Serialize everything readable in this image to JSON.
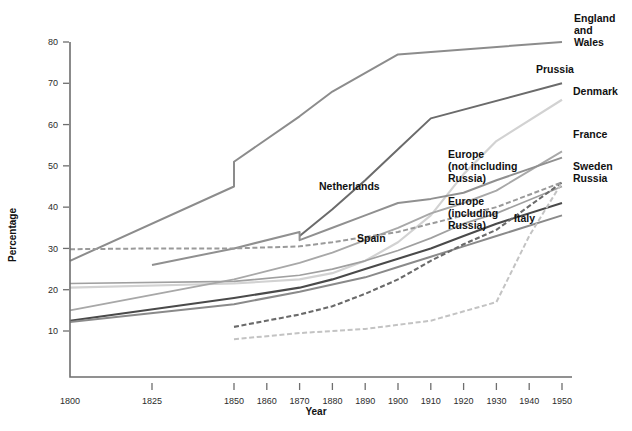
{
  "chart_data": {
    "type": "line",
    "title": "",
    "xlabel": "Year",
    "ylabel": "Percentage",
    "xlim": [
      1795,
      1955
    ],
    "ylim": [
      3,
      83
    ],
    "grid": false,
    "legend_position": "inline-right-labels",
    "x_ticks": [
      "1800",
      "1825",
      "1850",
      "1860",
      "1870",
      "1880",
      "1890",
      "1900",
      "1910",
      "1920",
      "1930",
      "1940",
      "1950"
    ],
    "x_tick_values": [
      1800,
      1825,
      1850,
      1860,
      1870,
      1880,
      1890,
      1900,
      1910,
      1920,
      1930,
      1940,
      1950
    ],
    "y_ticks": [
      "10",
      "20",
      "30",
      "40",
      "50",
      "60",
      "70",
      "80"
    ],
    "y_tick_values": [
      10,
      20,
      30,
      40,
      50,
      60,
      70,
      80
    ],
    "series": [
      {
        "name": "England and Wales",
        "label": "England\nand\nWales",
        "color": "#8c8c8c",
        "style": "solid",
        "width": 2.0,
        "x": [
          1800,
          1850,
          1850,
          1870,
          1880,
          1900,
          1950
        ],
        "y": [
          27,
          45,
          51,
          62,
          68,
          77,
          80
        ]
      },
      {
        "name": "Prussia",
        "label": "Prussia",
        "color": "#6b6b6b",
        "style": "solid",
        "width": 2.0,
        "x": [
          1870,
          1880,
          1890,
          1900,
          1910,
          1950
        ],
        "y": [
          33,
          39.5,
          46.5,
          54,
          61.5,
          70
        ]
      },
      {
        "name": "Denmark",
        "label": "Denmark",
        "color": "#d2d2d2",
        "style": "solid",
        "width": 2.2,
        "x": [
          1800,
          1850,
          1870,
          1880,
          1890,
          1900,
          1910,
          1920,
          1930,
          1950
        ],
        "y": [
          20.5,
          21.5,
          22.5,
          24,
          27,
          31.5,
          38,
          48,
          56,
          66
        ]
      },
      {
        "name": "France",
        "label": "France",
        "color": "#a8a8a8",
        "style": "solid",
        "width": 1.9,
        "x": [
          1800,
          1850,
          1860,
          1870,
          1880,
          1890,
          1900,
          1910,
          1920,
          1930,
          1950
        ],
        "y": [
          15,
          22.5,
          24.5,
          26.5,
          29,
          32,
          35,
          38.5,
          41,
          44,
          53.5
        ]
      },
      {
        "name": "Netherlands",
        "label": "Netherlands",
        "color": "#909090",
        "style": "solid",
        "width": 2.0,
        "x": [
          1825,
          1850,
          1870,
          1870,
          1880,
          1890,
          1900,
          1910,
          1920,
          1930,
          1950
        ],
        "y": [
          26,
          30,
          34,
          32,
          35,
          38,
          41,
          42,
          43.5,
          46.5,
          52
        ]
      },
      {
        "name": "Europe (not including Russia)",
        "label": "Europe\n(not including\nRussia)",
        "color": "#a0a0a0",
        "style": "solid",
        "width": 1.7,
        "x": [
          1800,
          1850,
          1870,
          1880,
          1890,
          1900,
          1910,
          1920,
          1930,
          1950
        ],
        "y": [
          21.5,
          22,
          23.5,
          25,
          27,
          29.5,
          32.5,
          36,
          38.5,
          45
        ]
      },
      {
        "name": "Europe (including Russia)",
        "label": "Europe\n(including\nRussia)",
        "color": "#4a4a4a",
        "style": "solid",
        "width": 2.1,
        "x": [
          1800,
          1850,
          1870,
          1880,
          1890,
          1900,
          1910,
          1920,
          1930,
          1950
        ],
        "y": [
          12.5,
          18,
          20.5,
          22.5,
          25,
          27.5,
          30,
          33,
          36,
          41
        ]
      },
      {
        "name": "Spain",
        "label": "Spain",
        "color": "#8a8a8a",
        "style": "solid",
        "width": 2.0,
        "x": [
          1800,
          1850,
          1870,
          1890,
          1900,
          1910,
          1920,
          1930,
          1950
        ],
        "y": [
          12.2,
          16.5,
          19.5,
          23,
          25.5,
          28,
          30.5,
          33,
          38
        ]
      },
      {
        "name": "Italy",
        "label": "Italy",
        "color": "#6a6a6a",
        "style": "dashed",
        "width": 2.1,
        "x": [
          1850,
          1870,
          1880,
          1890,
          1900,
          1910,
          1920,
          1930,
          1950
        ],
        "y": [
          11,
          14,
          16,
          19,
          22.5,
          27,
          31,
          34.5,
          46
        ]
      },
      {
        "name": "Sweden",
        "label": "Sweden",
        "color": "#9a9a9a",
        "style": "dashed",
        "width": 2.0,
        "x": [
          1800,
          1825,
          1850,
          1870,
          1880,
          1900,
          1910,
          1930,
          1950
        ],
        "y": [
          29.8,
          30,
          30,
          30.5,
          31.5,
          34,
          36,
          40,
          46
        ]
      },
      {
        "name": "Russia",
        "label": "Russia",
        "color": "#c3c3c3",
        "style": "dashed",
        "width": 2.0,
        "x": [
          1850,
          1870,
          1890,
          1910,
          1930,
          1940,
          1950
        ],
        "y": [
          8,
          9.5,
          10.5,
          12.5,
          17,
          33,
          46
        ]
      }
    ],
    "annotations": [
      {
        "id": "england-wales-label",
        "text_lines": [
          "England",
          "and",
          "Wales"
        ],
        "x_px": 574,
        "y_px": 22
      },
      {
        "id": "prussia-label",
        "text_lines": [
          "Prussia"
        ],
        "x_px": 536,
        "y_px": 73
      },
      {
        "id": "denmark-label",
        "text_lines": [
          "Denmark"
        ],
        "x_px": 573,
        "y_px": 95
      },
      {
        "id": "france-label",
        "text_lines": [
          "France"
        ],
        "x_px": 573,
        "y_px": 138
      },
      {
        "id": "sweden-russia-label",
        "text_lines": [
          "Sweden",
          "Russia"
        ],
        "x_px": 573,
        "y_px": 170
      },
      {
        "id": "europe-not-russia-label",
        "text_lines": [
          "Europe",
          "(not including",
          "Russia)"
        ],
        "x_px": 448,
        "y_px": 158
      },
      {
        "id": "europe-including-russia-label",
        "text_lines": [
          "Europe",
          "(including",
          "Russia)"
        ],
        "x_px": 448,
        "y_px": 205
      },
      {
        "id": "netherlands-label",
        "text_lines": [
          "Netherlands"
        ],
        "x_px": 319,
        "y_px": 190
      },
      {
        "id": "italy-label",
        "text_lines": [
          "Italy"
        ],
        "x_px": 514,
        "y_px": 222
      },
      {
        "id": "spain-label",
        "text_lines": [
          "Spain"
        ],
        "x_px": 357,
        "y_px": 242
      }
    ]
  },
  "axes": {
    "y_title": "Percentage",
    "x_title": "Year"
  },
  "geometry": {
    "plot_left_px": 70,
    "plot_right_px": 562,
    "plot_top_px": 16,
    "plot_bottom_px": 377,
    "y_80_px": 42,
    "y_10_px": 331,
    "x_1800_px": 70,
    "x_1950_px": 562
  }
}
